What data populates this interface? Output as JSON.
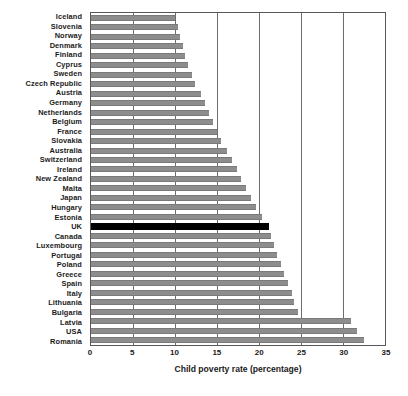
{
  "chart_data": {
    "type": "bar",
    "orientation": "horizontal",
    "title": "",
    "xlabel": "Child poverty rate (percentage)",
    "ylabel": "",
    "xlim": [
      0,
      35
    ],
    "xticks": [
      0,
      5,
      10,
      15,
      20,
      25,
      30,
      35
    ],
    "grid": true,
    "legend": null,
    "highlight_category": "UK",
    "highlight_color": "#000000",
    "bar_color": "#8d8d8d",
    "categories": [
      "Iceland",
      "Slovenia",
      "Norway",
      "Denmark",
      "Finland",
      "Cyprus",
      "Sweden",
      "Czech Republic",
      "Austria",
      "Germany",
      "Netherlands",
      "Belgium",
      "France",
      "Slovakia",
      "Australia",
      "Switzerland",
      "Ireland",
      "New Zealand",
      "Malta",
      "Japan",
      "Hungary",
      "Estonia",
      "UK",
      "Canada",
      "Luxembourg",
      "Portugal",
      "Poland",
      "Greece",
      "Spain",
      "Italy",
      "Lithuania",
      "Bulgaria",
      "Latvia",
      "USA",
      "Romania"
    ],
    "values": [
      10.0,
      10.3,
      10.6,
      10.9,
      11.2,
      11.6,
      12.0,
      12.4,
      13.1,
      13.6,
      14.0,
      14.5,
      15.0,
      15.5,
      16.2,
      16.8,
      17.4,
      17.9,
      18.5,
      19.0,
      19.7,
      20.4,
      21.2,
      21.4,
      21.8,
      22.2,
      22.6,
      23.0,
      23.4,
      23.9,
      24.2,
      24.6,
      31.0,
      31.7,
      32.5
    ]
  }
}
